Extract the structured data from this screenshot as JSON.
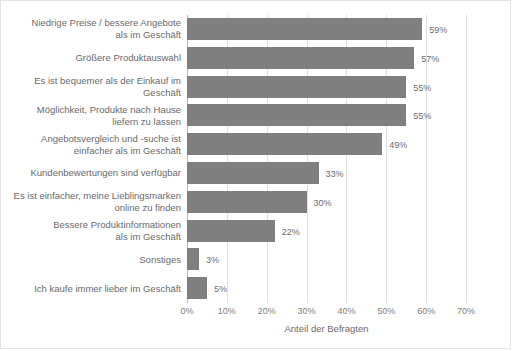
{
  "chart_data": {
    "type": "bar",
    "orientation": "horizontal",
    "title": "",
    "subtitle": "",
    "xlabel": "Anteil der Befragten",
    "ylabel": "",
    "xlim": [
      0,
      70
    ],
    "xticks": [
      "0%",
      "10%",
      "20%",
      "30%",
      "40%",
      "50%",
      "60%",
      "70%"
    ],
    "xtick_values": [
      0,
      10,
      20,
      30,
      40,
      50,
      60,
      70
    ],
    "grid": true,
    "legend": null,
    "bar_color": "#7f7f7f",
    "gridline_color": "#e0e0e0",
    "label_color": "#6a6a6a",
    "categories": [
      "Niedrige Preise / bessere Angebote\nals im Geschäft",
      "Größere  Produktauswahl",
      "Es ist bequemer als der Einkauf im\nGeschäft",
      "Möglichkeit, Produkte nach Hause\nliefern zu lassen",
      "Angebotsvergleich und -suche ist\neinfacher als im Geschäft",
      "Kundenbewertungen sind verfügbar",
      "Es ist einfacher, meine Lieblingsmarken\nonline zu finden",
      "Bessere Produktinformationen\nals im Geschäft",
      "Sonstiges",
      "Ich kaufe immer lieber im Geschäft"
    ],
    "values": [
      59,
      57,
      55,
      55,
      49,
      33,
      30,
      22,
      3,
      5
    ],
    "value_labels": [
      "59%",
      "57%",
      "55%",
      "55%",
      "49%",
      "33%",
      "30%",
      "22%",
      "3%",
      "5%"
    ]
  }
}
